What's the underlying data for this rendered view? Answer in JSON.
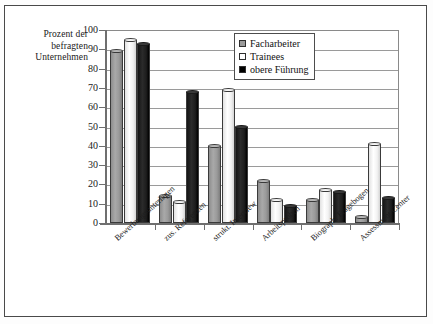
{
  "chart_data": {
    "type": "bar",
    "title": "",
    "xlabel": "",
    "ylabel": "Prozent der befragten Unternehmen",
    "ylabel_lines": [
      "Prozent der",
      "befragten",
      "Unternehmen"
    ],
    "ylim": [
      0,
      100
    ],
    "ytick_step": 10,
    "yticks": [
      100,
      90,
      80,
      70,
      60,
      50,
      40,
      30,
      20,
      10,
      0
    ],
    "grid": true,
    "grid_axis": "y",
    "legend_position": "top-right",
    "categories": [
      "Bewerbungsunterlagen",
      "zus. Referenzen",
      "strukt. Interview",
      "Arbeitsproben",
      "Biograph. Fragebogen",
      "Assessment Center"
    ],
    "series": [
      {
        "name": "Facharbeiter",
        "color": "#9a9a9a",
        "values": [
          89,
          14,
          40,
          22,
          12,
          3
        ]
      },
      {
        "name": "Trainees",
        "color": "#ffffff",
        "values": [
          95,
          11,
          69,
          12,
          17,
          41
        ]
      },
      {
        "name": "obere Führung",
        "color": "#000000",
        "values": [
          93,
          68,
          50,
          9,
          16,
          13
        ]
      }
    ]
  },
  "legend": {
    "items": [
      {
        "label": "Facharbeiter",
        "swatch": "gray-swatch"
      },
      {
        "label": "Trainees",
        "swatch": "white-swatch"
      },
      {
        "label": "obere Führung",
        "swatch": "black-swatch"
      }
    ]
  }
}
